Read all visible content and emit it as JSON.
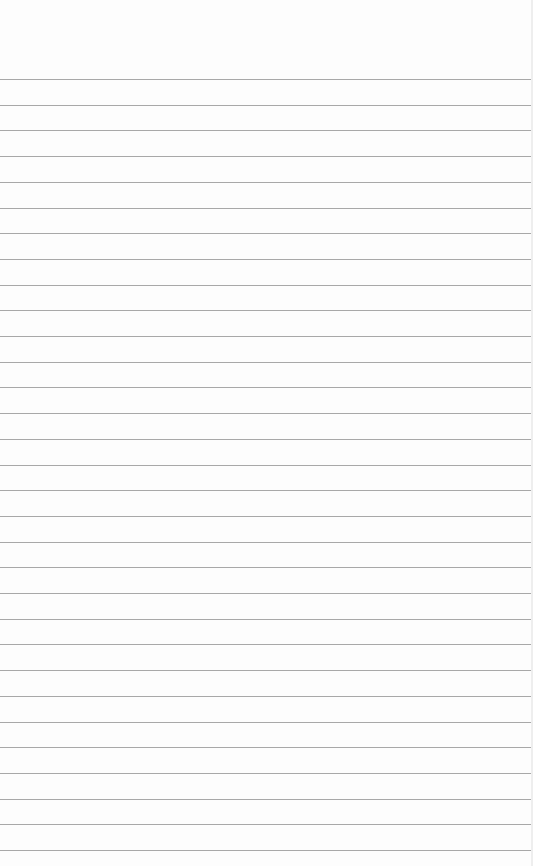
{
  "paper": {
    "type": "lined-paper",
    "background_color": "#fdfdfd",
    "line_color": "#a8a8a8",
    "first_line_y": 79,
    "line_spacing": 25.7,
    "line_count": 31
  }
}
